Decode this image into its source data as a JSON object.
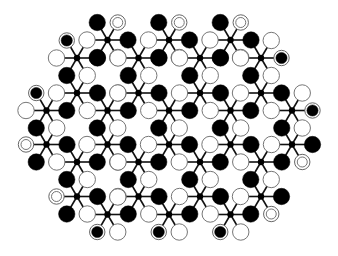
{
  "board": {
    "width": 338,
    "height": 256,
    "background": "#ffffff",
    "spoke_length": 20.5,
    "spoke_dy": 17.5,
    "hub_radius": 3.2,
    "piece_radius": 8.2,
    "colors": {
      "black": "#000000",
      "white": "#ffffff",
      "outline": "#666666",
      "line": "#111111"
    },
    "spoke_pattern": {
      "R": "black",
      "L": "white",
      "TL": "black",
      "TR": "white",
      "BL": "black",
      "BR": "white"
    },
    "hubs": [
      {
        "x": 107.5,
        "y": 40
      },
      {
        "x": 169,
        "y": 40
      },
      {
        "x": 230.5,
        "y": 40
      },
      {
        "x": 77,
        "y": 58
      },
      {
        "x": 138.5,
        "y": 58
      },
      {
        "x": 200,
        "y": 58
      },
      {
        "x": 261,
        "y": 58
      },
      {
        "x": 77,
        "y": 93
      },
      {
        "x": 138.5,
        "y": 93
      },
      {
        "x": 200,
        "y": 93
      },
      {
        "x": 261,
        "y": 93
      },
      {
        "x": 46.5,
        "y": 110.5
      },
      {
        "x": 107.5,
        "y": 110.5
      },
      {
        "x": 169,
        "y": 110.5
      },
      {
        "x": 230.5,
        "y": 110.5
      },
      {
        "x": 292,
        "y": 110.5
      },
      {
        "x": 46.5,
        "y": 144.5
      },
      {
        "x": 107.5,
        "y": 144.5
      },
      {
        "x": 169,
        "y": 144.5
      },
      {
        "x": 230.5,
        "y": 144.5
      },
      {
        "x": 292,
        "y": 144.5
      },
      {
        "x": 77,
        "y": 162
      },
      {
        "x": 138.5,
        "y": 162
      },
      {
        "x": 200,
        "y": 162
      },
      {
        "x": 261,
        "y": 162
      },
      {
        "x": 77,
        "y": 196.5
      },
      {
        "x": 138.5,
        "y": 196.5
      },
      {
        "x": 200,
        "y": 196.5
      },
      {
        "x": 261,
        "y": 196.5
      },
      {
        "x": 107.5,
        "y": 214.5
      },
      {
        "x": 169,
        "y": 214.5
      },
      {
        "x": 230.5,
        "y": 214.5
      }
    ],
    "special_pieces": [
      {
        "hub": 0,
        "dir": "TR",
        "type": "ringed-white"
      },
      {
        "hub": 1,
        "dir": "TR",
        "type": "ringed-white"
      },
      {
        "hub": 2,
        "dir": "TR",
        "type": "ringed-white"
      },
      {
        "hub": 16,
        "dir": "L",
        "type": "ringed-white"
      },
      {
        "hub": 20,
        "dir": "BR",
        "type": "ringed-white"
      },
      {
        "hub": 25,
        "dir": "L",
        "type": "ringed-white"
      },
      {
        "hub": 28,
        "dir": "BR",
        "type": "ringed-white"
      },
      {
        "hub": 3,
        "dir": "TL",
        "type": "ringed-black"
      },
      {
        "hub": 6,
        "dir": "R",
        "type": "ringed-black"
      },
      {
        "hub": 11,
        "dir": "TL",
        "type": "ringed-black"
      },
      {
        "hub": 15,
        "dir": "R",
        "type": "ringed-black"
      },
      {
        "hub": 29,
        "dir": "BL",
        "type": "ringed-black"
      },
      {
        "hub": 30,
        "dir": "BL",
        "type": "ringed-black"
      },
      {
        "hub": 31,
        "dir": "BL",
        "type": "ringed-black"
      }
    ]
  }
}
